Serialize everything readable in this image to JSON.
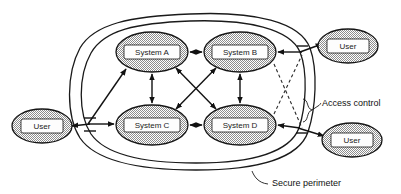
{
  "diagram": {
    "colors": {
      "stroke": "#151515",
      "node_fill_pattern": "checkerboard-gray",
      "node_fill_light": "#ffffff",
      "node_fill_dark": "#8a8a8a",
      "label_plate": "#fdfdfd",
      "background": "#ffffff"
    },
    "systems": [
      {
        "id": "system-a",
        "label": "System A",
        "cx": 152,
        "cy": 52,
        "rx": 36,
        "ry": 20
      },
      {
        "id": "system-b",
        "label": "System B",
        "cx": 240,
        "cy": 52,
        "rx": 36,
        "ry": 20
      },
      {
        "id": "system-c",
        "label": "System C",
        "cx": 152,
        "cy": 125,
        "rx": 36,
        "ry": 20
      },
      {
        "id": "system-d",
        "label": "System D",
        "cx": 240,
        "cy": 125,
        "rx": 36,
        "ry": 20
      }
    ],
    "users": [
      {
        "id": "user-top-right",
        "label": "User",
        "cx": 348,
        "cy": 46,
        "rx": 30,
        "ry": 17
      },
      {
        "id": "user-left",
        "label": "User",
        "cx": 42,
        "cy": 126,
        "rx": 30,
        "ry": 17
      },
      {
        "id": "user-bottom-right",
        "label": "User",
        "cx": 352,
        "cy": 140,
        "rx": 30,
        "ry": 17
      }
    ],
    "annotations": [
      {
        "id": "access-control",
        "label": "Access control",
        "x": 322,
        "y": 104
      },
      {
        "id": "secure-perimeter",
        "label": "Secure perimeter",
        "x": 272,
        "y": 184
      }
    ],
    "internal_links": [
      {
        "from": "system-a",
        "to": "system-b",
        "style": "double-arrow"
      },
      {
        "from": "system-c",
        "to": "system-d",
        "style": "double-arrow"
      },
      {
        "from": "system-a",
        "to": "system-c",
        "style": "double-arrow"
      },
      {
        "from": "system-b",
        "to": "system-d",
        "style": "double-arrow"
      },
      {
        "from": "system-a",
        "to": "system-d",
        "style": "double-arrow"
      },
      {
        "from": "system-b",
        "to": "system-c",
        "style": "double-arrow"
      }
    ],
    "external_links": [
      {
        "from": "user-left",
        "to": "system-a",
        "style": "double-arrow",
        "crosses": "perimeter"
      },
      {
        "from": "user-left",
        "to": "system-c",
        "style": "double-arrow",
        "crosses": "perimeter"
      },
      {
        "from": "user-top-right",
        "to": "system-b",
        "style": "double-arrow",
        "crosses": "perimeter"
      },
      {
        "from": "user-bottom-right",
        "to": "system-d",
        "style": "double-arrow",
        "crosses": "perimeter"
      },
      {
        "from": "system-b",
        "to": "access-point-lower",
        "style": "dashed"
      },
      {
        "from": "system-d",
        "to": "access-point-upper",
        "style": "dashed"
      }
    ],
    "boundaries": [
      {
        "id": "outer-perimeter",
        "kind": "rounded-closed-curve"
      },
      {
        "id": "inner-perimeter",
        "kind": "rounded-closed-curve"
      }
    ]
  }
}
